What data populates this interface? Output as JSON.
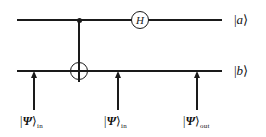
{
  "diagram": {
    "type": "quantum-circuit",
    "title": "",
    "wires": [
      {
        "id": "wire-a",
        "label": "|a⟩",
        "bra_open": "|",
        "symbol": "a",
        "ket_close": "⟩",
        "y": 20
      },
      {
        "id": "wire-b",
        "label": "|b⟩",
        "bra_open": "|",
        "symbol": "b",
        "ket_close": "⟩",
        "y": 71
      }
    ],
    "gates": [
      {
        "id": "cnot-control",
        "name": "control-dot",
        "wire": "wire-a",
        "x": 79
      },
      {
        "id": "cnot-target",
        "name": "cnot-target",
        "wire": "wire-b",
        "x": 79
      },
      {
        "id": "hadamard",
        "name": "hadamard-gate",
        "letter": "H",
        "wire": "wire-a",
        "x": 140
      }
    ],
    "annotations": [
      {
        "id": "psi-in-left",
        "psi": "Ψ",
        "subscript": "in",
        "x": 34,
        "text": "|Ψ⟩in"
      },
      {
        "id": "psi-in-mid",
        "psi": "Ψ",
        "subscript": "in",
        "x": 118,
        "text": "|Ψ⟩in"
      },
      {
        "id": "psi-out",
        "psi": "Ψ",
        "subscript": "out",
        "x": 197,
        "text": "|Ψ⟩out"
      }
    ],
    "colors": {
      "ink": "#1a1a1a",
      "text": "#111111",
      "background": "#ffffff"
    }
  }
}
